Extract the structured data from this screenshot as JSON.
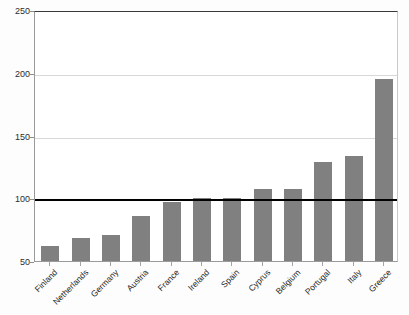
{
  "chart_data": {
    "type": "bar",
    "title": "",
    "subtitle": "",
    "xlabel": "",
    "ylabel": "",
    "categories": [
      "Finland",
      "Netherlands",
      "Germany",
      "Austria",
      "France",
      "Ireland",
      "Spain",
      "Cyprus",
      "Belgium",
      "Portugal",
      "Italy",
      "Greece"
    ],
    "values": [
      62,
      68,
      71,
      86,
      97,
      100,
      100,
      107,
      107,
      129,
      134,
      195
    ],
    "ylim": [
      50,
      250
    ],
    "yticks": [
      50,
      100,
      150,
      200,
      250
    ],
    "ytick_labels": [
      "50",
      "100",
      "150",
      "200",
      "250"
    ],
    "grid": true,
    "legend": false,
    "legend_position": "none",
    "annotations": [
      {
        "name": "reference-line",
        "value": 100,
        "orientation": "horizontal",
        "color": "#000000"
      }
    ],
    "bar_color": "#808080",
    "gridline_color": "#d8d8d8",
    "axis_color": "#9a9a9a",
    "background_color": "#ffffff"
  }
}
